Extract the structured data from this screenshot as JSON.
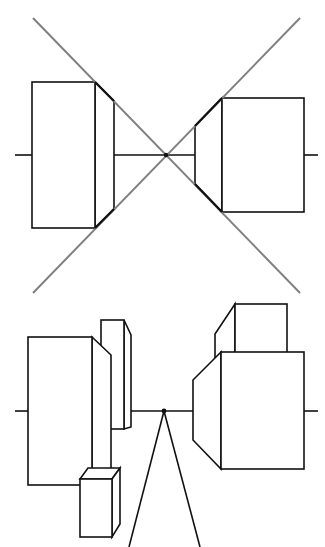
{
  "diagram": {
    "colors": {
      "background": "#ffffff",
      "line": "#111111",
      "guide": "#808080"
    },
    "top_panel": {
      "horizon_y": 155,
      "vanishing_point": [
        166,
        155
      ],
      "guide_lines": [
        {
          "from": [
            33,
            18
          ],
          "to": [
            300,
            293
          ]
        },
        {
          "from": [
            300,
            18
          ],
          "to": [
            33,
            293
          ]
        }
      ],
      "boxes": [
        {
          "name": "left-box",
          "front": [
            32,
            82,
            63,
            146
          ],
          "side": [
            [
              95,
              82
            ],
            [
              114,
              101
            ],
            [
              114,
              209
            ],
            [
              95,
              228
            ]
          ]
        },
        {
          "name": "right-box",
          "front": [
            222,
            98,
            82,
            114
          ],
          "side": [
            [
              222,
              98
            ],
            [
              195,
              126
            ],
            [
              195,
              184
            ],
            [
              222,
              212
            ]
          ]
        }
      ]
    },
    "bottom_panel": {
      "horizon_y": 411,
      "vanishing_point": [
        164,
        411
      ],
      "sight_lines": [
        {
          "from": [
            164,
            411
          ],
          "to": [
            129,
            547
          ]
        },
        {
          "from": [
            164,
            411
          ],
          "to": [
            200,
            547
          ]
        }
      ]
    }
  }
}
